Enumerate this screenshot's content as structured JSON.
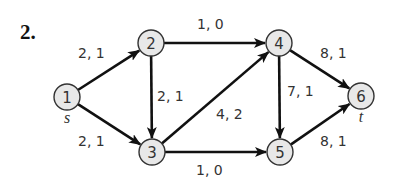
{
  "problem": {
    "number": "2."
  },
  "colors": {
    "node_fill": "#e8e8e8",
    "node_stroke": "#333333",
    "edge": "#111111",
    "text": "#333333"
  },
  "nodes": [
    {
      "id": "1",
      "label": "1",
      "x": 67,
      "y": 97,
      "terminal": "s"
    },
    {
      "id": "2",
      "label": "2",
      "x": 151,
      "y": 43
    },
    {
      "id": "3",
      "label": "3",
      "x": 152,
      "y": 152
    },
    {
      "id": "4",
      "label": "4",
      "x": 279,
      "y": 43
    },
    {
      "id": "5",
      "label": "5",
      "x": 280,
      "y": 152
    },
    {
      "id": "6",
      "label": "6",
      "x": 361,
      "y": 96,
      "terminal": "t"
    }
  ],
  "edges": [
    {
      "from": "1",
      "to": "2",
      "label": "2, 1",
      "label_x": 78,
      "label_y": 58
    },
    {
      "from": "1",
      "to": "3",
      "label": "2, 1",
      "label_x": 78,
      "label_y": 146
    },
    {
      "from": "2",
      "to": "4",
      "label": "1, 0",
      "label_x": 197,
      "label_y": 29
    },
    {
      "from": "2",
      "to": "3",
      "label": "2, 1",
      "label_x": 157,
      "label_y": 101
    },
    {
      "from": "3",
      "to": "4",
      "label": "4, 2",
      "label_x": 216,
      "label_y": 119
    },
    {
      "from": "3",
      "to": "5",
      "label": "1, 0",
      "label_x": 196,
      "label_y": 175
    },
    {
      "from": "4",
      "to": "6",
      "label": "8, 1",
      "label_x": 320,
      "label_y": 58
    },
    {
      "from": "4",
      "to": "5",
      "label": "7, 1",
      "label_x": 287,
      "label_y": 96
    },
    {
      "from": "5",
      "to": "6",
      "label": "8, 1",
      "label_x": 320,
      "label_y": 146
    }
  ],
  "terminals": {
    "source": "s",
    "sink": "t"
  }
}
